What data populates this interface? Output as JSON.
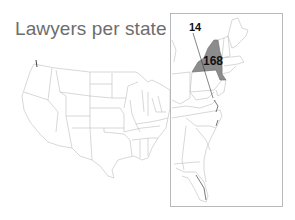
{
  "title": "Lawyers per state",
  "map": {
    "region": "United States (contiguous)",
    "inset": "Northeast / East Coast",
    "highlighted_state": "New York",
    "highlight_color": "#8c8c8c",
    "border_color": "#b8b8b8",
    "labels": [
      {
        "text": "14",
        "role": "callout-label"
      },
      {
        "text": "168",
        "role": "state-value"
      }
    ]
  }
}
